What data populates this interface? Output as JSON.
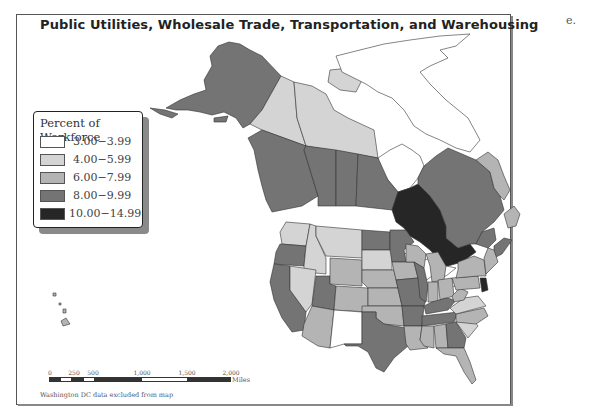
{
  "map": {
    "title": "Public Utilities, Wholesale Trade, Transportation, and Warehousing",
    "panel_letter": "e.",
    "footnote": "Washington DC data excluded from map"
  },
  "legend": {
    "title": "Percent of Workforce",
    "classes": [
      {
        "label": "3.00−3.99",
        "color": "#ffffff"
      },
      {
        "label": "4.00−5.99",
        "color": "#d4d4d4"
      },
      {
        "label": "6.00−7.99",
        "color": "#b4b4b4"
      },
      {
        "label": "8.00−9.99",
        "color": "#747474"
      },
      {
        "label": "10.00−14.99",
        "color": "#262626"
      }
    ]
  },
  "scale_bar": {
    "ticks": [
      "0",
      "250",
      "500",
      "1,000",
      "1,500",
      "2,000"
    ],
    "units": "Miles"
  },
  "regions": {
    "alaska": "8.00-9.99",
    "yukon": "4.00-5.99",
    "northwest_territories": "4.00-5.99",
    "nunavut": "4.00-5.99",
    "british_columbia": "8.00-9.99",
    "alberta": "8.00-9.99",
    "saskatchewan": "8.00-9.99",
    "manitoba": "8.00-9.99",
    "ontario": "10.00-14.99",
    "quebec": "8.00-9.99",
    "newfoundland_labrador": "6.00-7.99",
    "nova_scotia": "8.00-9.99",
    "new_brunswick": "8.00-9.99",
    "hawaii": "6.00-7.99",
    "washington": "4.00-5.99",
    "oregon": "8.00-9.99",
    "california": "8.00-9.99",
    "idaho": "4.00-5.99",
    "nevada": "4.00-5.99",
    "utah": "8.00-9.99",
    "arizona": "6.00-7.99",
    "montana": "4.00-5.99",
    "wyoming": "6.00-7.99",
    "colorado": "6.00-7.99",
    "new_mexico": "3.00-3.99",
    "north_dakota": "8.00-9.99",
    "south_dakota": "4.00-5.99",
    "nebraska": "6.00-7.99",
    "kansas": "6.00-7.99",
    "oklahoma": "6.00-7.99",
    "texas": "8.00-9.99",
    "minnesota": "8.00-9.99",
    "iowa": "6.00-7.99",
    "missouri": "8.00-9.99",
    "arkansas": "8.00-9.99",
    "louisiana": "6.00-7.99",
    "wisconsin": "6.00-7.99",
    "illinois": "8.00-9.99",
    "michigan": "6.00-7.99",
    "indiana": "6.00-7.99",
    "ohio": "6.00-7.99",
    "kentucky": "8.00-9.99",
    "tennessee": "8.00-9.99",
    "mississippi": "6.00-7.99",
    "alabama": "6.00-7.99",
    "georgia": "8.00-9.99",
    "florida": "6.00-7.99",
    "south_carolina": "4.00-5.99",
    "north_carolina": "6.00-7.99",
    "virginia": "4.00-5.99",
    "west_virginia": "6.00-7.99",
    "pennsylvania": "6.00-7.99",
    "new_york": "6.00-7.99",
    "new_jersey": "10.00-14.99",
    "new_england": "6.00-7.99"
  }
}
